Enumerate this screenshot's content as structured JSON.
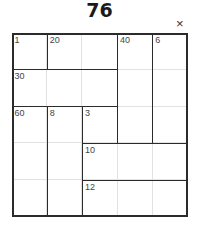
{
  "puzzle": {
    "title": "76",
    "close_label": "×",
    "size": 5,
    "cages": [
      {
        "clue": "1",
        "r": 0,
        "c": 0,
        "rows": 1,
        "cols": 1
      },
      {
        "clue": "20",
        "r": 0,
        "c": 1,
        "rows": 1,
        "cols": 2
      },
      {
        "clue": "40",
        "r": 0,
        "c": 3,
        "rows": 3,
        "cols": 1
      },
      {
        "clue": "6",
        "r": 0,
        "c": 4,
        "rows": 3,
        "cols": 1
      },
      {
        "clue": "30",
        "r": 1,
        "c": 0,
        "rows": 1,
        "cols": 3
      },
      {
        "clue": "60",
        "r": 2,
        "c": 0,
        "rows": 3,
        "cols": 1
      },
      {
        "clue": "8",
        "r": 2,
        "c": 1,
        "rows": 3,
        "cols": 1
      },
      {
        "clue": "3",
        "r": 2,
        "c": 2,
        "rows": 1,
        "cols": 1
      },
      {
        "clue": "10",
        "r": 3,
        "c": 2,
        "rows": 1,
        "cols": 3
      },
      {
        "clue": "12",
        "r": 4,
        "c": 2,
        "rows": 1,
        "cols": 3
      }
    ]
  }
}
